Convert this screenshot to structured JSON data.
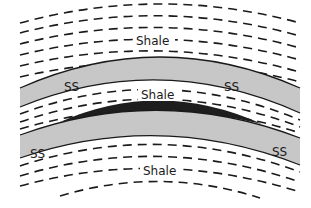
{
  "diagram": {
    "type": "geologic cross-section (anticline)",
    "colors": {
      "background": "#ffffff",
      "sandstone_fill": "#c8c8c8",
      "dark_lens": "#1e1e1e",
      "line": "#1a1a1a"
    },
    "labels": {
      "shale_top": "Shale",
      "shale_middle": "Shale",
      "shale_bottom": "Shale",
      "ss_top_left": "SS",
      "ss_top_right": "SS",
      "ss_bottom_left": "SS",
      "ss_bottom_right": "SS"
    },
    "layers": [
      {
        "name": "Shale",
        "position": "top",
        "pattern": "dashed lines"
      },
      {
        "name": "SS",
        "position": "upper sandstone",
        "pattern": "stippled gray"
      },
      {
        "name": "Shale",
        "position": "middle",
        "pattern": "dashed lines"
      },
      {
        "name": "dark lens",
        "position": "crest, between middle shale and lower sandstone",
        "pattern": "solid dark"
      },
      {
        "name": "SS",
        "position": "lower sandstone",
        "pattern": "stippled gray"
      },
      {
        "name": "Shale",
        "position": "bottom",
        "pattern": "dashed lines"
      }
    ]
  }
}
